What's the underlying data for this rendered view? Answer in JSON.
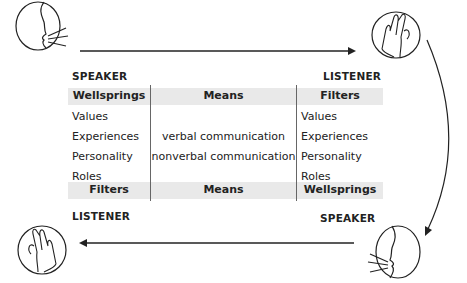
{
  "diagram": {
    "top": {
      "left_role": "SPEAKER",
      "right_role": "LISTENER",
      "left_icon": "speaker-head-icon",
      "right_icon": "listener-ear-icon"
    },
    "bottom": {
      "left_role": "LISTENER",
      "right_role": "SPEAKER",
      "left_icon": "listener-ear-icon",
      "right_icon": "speaker-head-icon"
    },
    "table": {
      "top_headers": [
        "Wellsprings",
        "Means",
        "Filters"
      ],
      "left_items": [
        "Values",
        "Experiences",
        "Personality",
        "Roles"
      ],
      "middle_items": [
        "verbal communication",
        "nonverbal communication"
      ],
      "right_items": [
        "Values",
        "Experiences",
        "Personality",
        "Roles"
      ],
      "bottom_headers": [
        "Filters",
        "Means",
        "Wellsprings"
      ]
    },
    "colors": {
      "header_bg": "#e9e9e9",
      "line": "#222222"
    }
  }
}
